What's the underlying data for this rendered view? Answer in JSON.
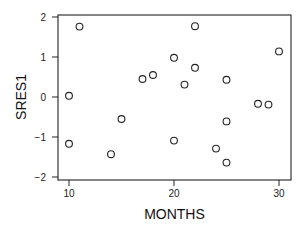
{
  "chart_data": {
    "type": "scatter",
    "title": "",
    "xlabel": "MONTHS",
    "ylabel": "SRES1",
    "xlim": [
      8.9,
      31.2
    ],
    "ylim": [
      -2.05,
      2.05
    ],
    "xticks": [
      10,
      20,
      30
    ],
    "yticks": [
      -2,
      -1,
      0,
      1,
      2
    ],
    "xtick_labels": [
      "10",
      "20",
      "30"
    ],
    "ytick_labels": [
      "−2",
      "−1",
      "0",
      "1",
      "2"
    ],
    "grid": false,
    "legend": null,
    "marker": "open-circle",
    "series": [
      {
        "name": "SRES1 vs MONTHS",
        "x": [
          10,
          10,
          11,
          14,
          15,
          17,
          18,
          20,
          20,
          21,
          22,
          22,
          24,
          25,
          25,
          25,
          28,
          29,
          30
        ],
        "y": [
          0.03,
          -1.17,
          1.76,
          -1.43,
          -0.55,
          0.45,
          0.55,
          0.98,
          -1.09,
          0.31,
          1.77,
          0.73,
          -1.29,
          0.43,
          -0.61,
          -1.64,
          -0.17,
          -0.19,
          1.14
        ]
      }
    ]
  }
}
